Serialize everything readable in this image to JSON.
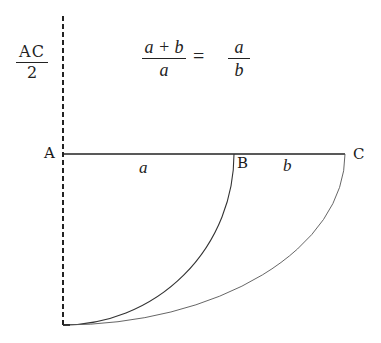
{
  "diagram": {
    "header": {
      "half_segment": {
        "numerator": "AC",
        "denominator": "2"
      },
      "equation": {
        "left": {
          "numerator": "a + b",
          "denominator": "a"
        },
        "operator": "=",
        "right": {
          "numerator": "a",
          "denominator": "b"
        }
      }
    },
    "points": {
      "A": {
        "label": "A",
        "x": 63,
        "y": 154
      },
      "B": {
        "label": "B",
        "x": 234,
        "y": 154
      },
      "C": {
        "label": "C",
        "x": 345,
        "y": 154
      },
      "bottom": {
        "x": 63,
        "y": 325
      }
    },
    "segments": {
      "AB": {
        "label": "a"
      },
      "BC": {
        "label": "b"
      }
    },
    "colors": {
      "line": "#222222",
      "arc_inner": "#333333",
      "arc_outer": "#555555",
      "background": "#ffffff"
    }
  }
}
